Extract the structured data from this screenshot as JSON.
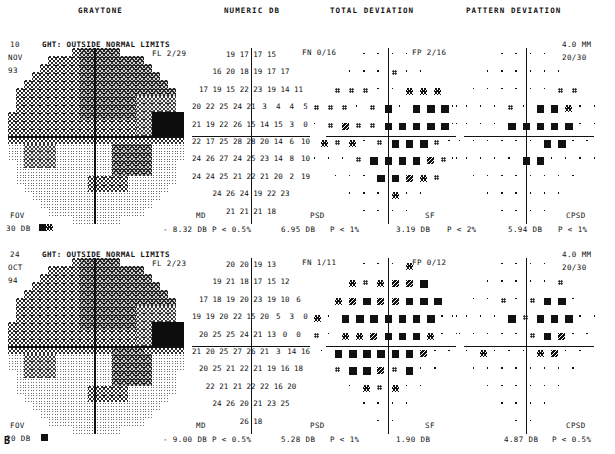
{
  "figure_label": "B",
  "column_headers": [
    {
      "label": "GRAYTONE",
      "x": 78
    },
    {
      "label": "NUMERIC DB",
      "x": 224
    },
    {
      "label": "TOTAL DEVIATION",
      "x": 330
    },
    {
      "label": "PATTERN DEVIATION",
      "x": 466
    }
  ],
  "panels": [
    {
      "id": "panel-top",
      "date": {
        "day": "10",
        "month": "NOV",
        "year": "93"
      },
      "ght": "GHT: OUTSIDE NORMAL LIMITS",
      "fl": "FL  2/29",
      "fn": "FN  0/16",
      "fp": "FP  2/16",
      "pupil": "4.0 MM",
      "acuity": "20/30",
      "fov_label": "FOV",
      "fov_value": "30 DB",
      "md_label": "MD",
      "md_value": "- 8.32 DB",
      "md_p": "P < 0.5%",
      "psd_label": "PSD",
      "psd_value": "6.95 DB",
      "psd_p": "P <  1%",
      "sf_label": "SF",
      "sf_value": "3.19 DB",
      "sf_p": "P <  2%",
      "cpsd_label": "CPSD",
      "cpsd_value": "5.94 DB",
      "cpsd_p": "P <  1%",
      "numeric_db_rows": [
        [
          "",
          "",
          "19",
          "17",
          "17",
          "15",
          "",
          ""
        ],
        [
          "",
          "16",
          "20",
          "18",
          "19",
          "17",
          "17",
          ""
        ],
        [
          "17",
          "19",
          "15",
          "22",
          "23",
          "19",
          "14",
          "11"
        ],
        [
          "20",
          "22",
          "25",
          "24",
          "21",
          "3",
          "4",
          "4",
          "5"
        ],
        [
          "21",
          "19",
          "22",
          "26",
          "15",
          "14",
          "15",
          "3",
          "0"
        ],
        [
          "22",
          "17",
          "25",
          "28",
          "28",
          "20",
          "14",
          "6",
          "10"
        ],
        [
          "24",
          "26",
          "27",
          "24",
          "25",
          "23",
          "14",
          "8",
          "10"
        ],
        [
          "24",
          "24",
          "25",
          "21",
          "22",
          "21",
          "20",
          "2",
          "19"
        ],
        [
          "",
          "24",
          "26",
          "24",
          "19",
          "22",
          "23",
          ""
        ],
        [
          "",
          "",
          "21",
          "21",
          "21",
          "18",
          "",
          ""
        ]
      ]
    },
    {
      "id": "panel-bottom",
      "date": {
        "day": "24",
        "month": "OCT",
        "year": "94"
      },
      "ght": "GHT: OUTSIDE NORMAL LIMITS",
      "fl": "FL  2/23",
      "fn": "FN  1/11",
      "fp": "FP  0/12",
      "pupil": "4.0 MM",
      "acuity": "20/30",
      "fov_label": "FOV",
      "fov_value": "20 DB",
      "md_label": "MD",
      "md_value": "- 9.00 DB",
      "md_p": "P < 0.5%",
      "psd_label": "PSD",
      "psd_value": "5.28 DB",
      "psd_p": "P <  1%",
      "sf_label": "SF",
      "sf_value": "1.90 DB",
      "sf_p": "",
      "cpsd_label": "CPSD",
      "cpsd_value": "4.87 DB",
      "cpsd_p": "P < 0.5%",
      "numeric_db_rows": [
        [
          "",
          "",
          "20",
          "20",
          "19",
          "13",
          "",
          ""
        ],
        [
          "",
          "19",
          "21",
          "18",
          "17",
          "15",
          "12",
          ""
        ],
        [
          "17",
          "18",
          "19",
          "20",
          "23",
          "19",
          "10",
          "6"
        ],
        [
          "19",
          "19",
          "20",
          "22",
          "15",
          "20",
          "5",
          "3",
          "0"
        ],
        [
          "20",
          "25",
          "25",
          "24",
          "21",
          "13",
          "0",
          "0",
          ""
        ],
        [
          "21",
          "20",
          "25",
          "27",
          "26",
          "21",
          "3",
          "14",
          "16"
        ],
        [
          "20",
          "25",
          "21",
          "22",
          "21",
          "19",
          "16",
          "18",
          ""
        ],
        [
          "22",
          "21",
          "21",
          "22",
          "22",
          "16",
          "20",
          "",
          ""
        ],
        [
          "",
          "24",
          "26",
          "20",
          "21",
          "23",
          "25",
          ""
        ],
        [
          "",
          "",
          "26",
          "",
          "",
          "18",
          "",
          ""
        ]
      ]
    }
  ],
  "symbol_legend": {
    "dot": "p>5% normal",
    "double-dot": "p<5%",
    "hatched": "p<2%",
    "half-filled": "p<1%",
    "filled": "p<0.5%"
  },
  "colors": {
    "ink": "#111111",
    "paper": "#ffffff"
  }
}
